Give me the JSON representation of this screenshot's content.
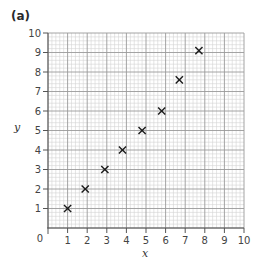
{
  "panel_label": "(a)",
  "chart_data": {
    "type": "scatter",
    "title": "",
    "xlabel": "x",
    "ylabel": "y",
    "xlim": [
      0,
      10
    ],
    "ylim": [
      0,
      10
    ],
    "x_ticks": [
      "0",
      "1",
      "2",
      "3",
      "4",
      "5",
      "6",
      "7",
      "8",
      "9",
      "10"
    ],
    "y_ticks": [
      "1",
      "2",
      "3",
      "4",
      "5",
      "6",
      "7",
      "8",
      "9",
      "10"
    ],
    "origin_label": "0",
    "grid": true,
    "grid_minor_divisions": 5,
    "marker": "x",
    "marker_color": "#1a1a1a",
    "grid_major_color": "#9a9a9a",
    "grid_minor_color": "#d4d4d4",
    "series": [
      {
        "name": "points",
        "x": [
          1.0,
          1.9,
          2.9,
          3.8,
          4.8,
          5.8,
          6.7,
          7.7
        ],
        "y": [
          1.0,
          2.0,
          3.0,
          4.0,
          5.0,
          6.0,
          7.6,
          9.1
        ]
      }
    ]
  }
}
